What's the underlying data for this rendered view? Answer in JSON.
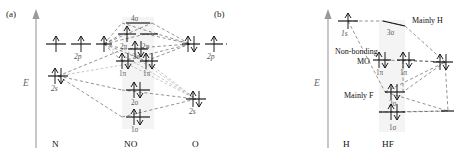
{
  "figure": {
    "type": "molecular-orbital-energy-level-diagram",
    "panels": [
      {
        "id": "a",
        "label": "(a)",
        "energy_axis_label": "E",
        "molecule": "NO",
        "left_atom": "N",
        "right_atom": "O",
        "bottom_labels": {
          "left": "N",
          "center": "NO",
          "right": "O"
        },
        "left_atomic_orbitals": [
          {
            "label": "2p",
            "degeneracy": 3,
            "electrons_per_level": [
              1,
              1,
              1
            ]
          },
          {
            "label": "2s",
            "degeneracy": 1,
            "electrons_per_level": [
              2
            ]
          }
        ],
        "right_atomic_orbitals": [
          {
            "label": "2p",
            "degeneracy": 3,
            "electrons_per_level": [
              2,
              1,
              1
            ]
          },
          {
            "label": "2s",
            "degeneracy": 1,
            "electrons_per_level": [
              2
            ]
          }
        ],
        "molecular_orbitals": [
          {
            "label": "4σ",
            "electrons": 0
          },
          {
            "label": "2π",
            "electrons": 1
          },
          {
            "label": "2π",
            "electrons": 0
          },
          {
            "label": "3σ",
            "electrons": 2
          },
          {
            "label": "1π",
            "electrons": 2
          },
          {
            "label": "1π",
            "electrons": 2
          },
          {
            "label": "2σ",
            "electrons": 2
          },
          {
            "label": "1σ",
            "electrons": 2
          }
        ]
      },
      {
        "id": "b",
        "label": "(b)",
        "energy_axis_label": "E",
        "molecule": "HF",
        "left_atom": "H",
        "right_atom": "F",
        "bottom_labels": {
          "left": "H",
          "center": "HF"
        },
        "left_atomic_orbitals": [
          {
            "label": "1s",
            "degeneracy": 1,
            "electrons_per_level": [
              1
            ]
          }
        ],
        "right_atomic_orbitals": [
          {
            "label": "",
            "degeneracy": 1,
            "electrons_per_level": [
              2
            ]
          },
          {
            "label": "",
            "degeneracy": 1,
            "electrons_per_level": [
              0
            ]
          }
        ],
        "molecular_orbitals": [
          {
            "label": "3σ",
            "electrons": 0
          },
          {
            "label": "1π",
            "electrons": 2
          },
          {
            "label": "1π",
            "electrons": 2
          },
          {
            "label": "2σ",
            "electrons": 2
          },
          {
            "label": "1σ",
            "electrons": 2
          }
        ],
        "annotations": [
          {
            "text": "Mainly H"
          },
          {
            "text": "Non-bonding"
          },
          {
            "text": "MO"
          },
          {
            "text": "Mainly F"
          }
        ]
      }
    ]
  }
}
